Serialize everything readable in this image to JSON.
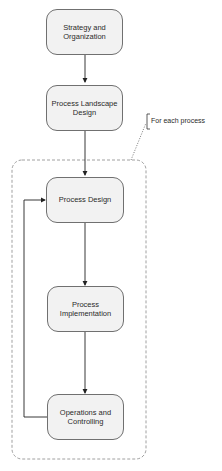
{
  "diagram": {
    "type": "flowchart",
    "nodes": [
      {
        "id": "strategy",
        "label": "Strategy and Organization"
      },
      {
        "id": "landscape",
        "label": "Process Landscape Design"
      },
      {
        "id": "design",
        "label": "Process Design"
      },
      {
        "id": "implementation",
        "label": "Process Implementation"
      },
      {
        "id": "operations",
        "label": "Operations and Controlling"
      }
    ],
    "edges": [
      {
        "from": "strategy",
        "to": "landscape"
      },
      {
        "from": "landscape",
        "to": "design"
      },
      {
        "from": "design",
        "to": "implementation"
      },
      {
        "from": "implementation",
        "to": "operations"
      },
      {
        "from": "operations",
        "to": "design",
        "type": "feedback-loop"
      }
    ],
    "group": {
      "label": "For each process",
      "members": [
        "design",
        "implementation",
        "operations"
      ]
    },
    "colors": {
      "node_fill": "#f2f2f2",
      "node_border": "#707070",
      "edge": "#222222",
      "group_border": "#888888"
    }
  }
}
